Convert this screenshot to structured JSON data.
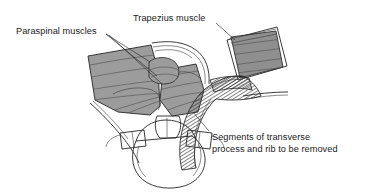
{
  "figure": {
    "background_color": "#ffffff",
    "width": 371,
    "height": 194
  },
  "colors": {
    "background": "#ffffff",
    "muscle_fill": "#9c9c9c",
    "muscle_fill_dark": "#8e8e8e",
    "flap_fill": "#8f8f8f",
    "bone_fill": "#ffffff",
    "outline": "#262626",
    "text": "#1a1a1a",
    "hatch_line": "#2b2b2b"
  },
  "labels": [
    {
      "id": "paraspinal-muscles",
      "text": "Paraspinal muscles",
      "x": 16,
      "y": 31,
      "anchor": "start"
    },
    {
      "id": "trapezius-muscle",
      "text": "Trapezius muscle",
      "x": 133,
      "y": 19,
      "anchor": "start"
    }
  ],
  "caption": {
    "id": "segments-caption",
    "lines": [
      "Segments of transverse",
      "process and rib to be removed"
    ],
    "x": 212,
    "y": 140,
    "line_height": 12
  },
  "anatomy": {
    "structures": [
      {
        "name": "left-paraspinal-muscle-mass",
        "fill": "muscle_fill"
      },
      {
        "name": "right-paraspinal-muscle-mass",
        "fill": "muscle_fill"
      },
      {
        "name": "central-paraspinal-bundle",
        "fill": "muscle_fill"
      },
      {
        "name": "trapezius-flap",
        "fill": "flap_fill"
      },
      {
        "name": "vertebral-body",
        "fill": "bone_fill"
      },
      {
        "name": "spinous-process",
        "fill": "bone_fill"
      },
      {
        "name": "transverse-process-left",
        "fill": "bone_fill"
      },
      {
        "name": "transverse-process-right",
        "fill": "bone_fill"
      },
      {
        "name": "rib-left",
        "fill": "none"
      },
      {
        "name": "rib-right",
        "fill": "none"
      },
      {
        "name": "resection-hatch-region",
        "fill": "hatch"
      }
    ]
  }
}
